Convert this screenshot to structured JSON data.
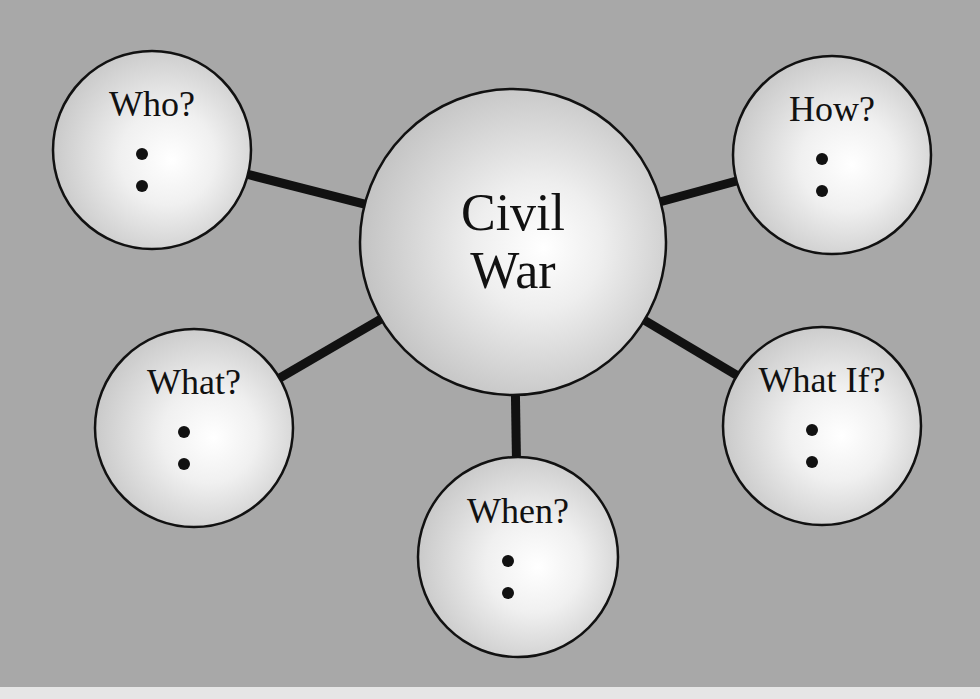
{
  "diagram": {
    "type": "concept-map",
    "background_color": "#a8a8a8",
    "bottom_strip_color": "#e6e6e6",
    "center": {
      "id": "civil-war",
      "lines": [
        "Civil",
        "War"
      ],
      "cx": 513,
      "cy": 242,
      "r": 153
    },
    "nodes": [
      {
        "id": "who",
        "label": "Who?",
        "cx": 152,
        "cy": 150,
        "r": 99,
        "bullets": 2
      },
      {
        "id": "how",
        "label": "How?",
        "cx": 832,
        "cy": 155,
        "r": 99,
        "bullets": 2
      },
      {
        "id": "what",
        "label": "What?",
        "cx": 194,
        "cy": 428,
        "r": 99,
        "bullets": 2
      },
      {
        "id": "when",
        "label": "When?",
        "cx": 518,
        "cy": 557,
        "r": 100,
        "bullets": 2
      },
      {
        "id": "what-if",
        "label": "What If?",
        "cx": 822,
        "cy": 426,
        "r": 99,
        "bullets": 2
      }
    ],
    "edges": [
      {
        "from": "civil-war",
        "to": "who"
      },
      {
        "from": "civil-war",
        "to": "how"
      },
      {
        "from": "civil-war",
        "to": "what"
      },
      {
        "from": "civil-war",
        "to": "when"
      },
      {
        "from": "civil-war",
        "to": "what-if"
      }
    ]
  }
}
